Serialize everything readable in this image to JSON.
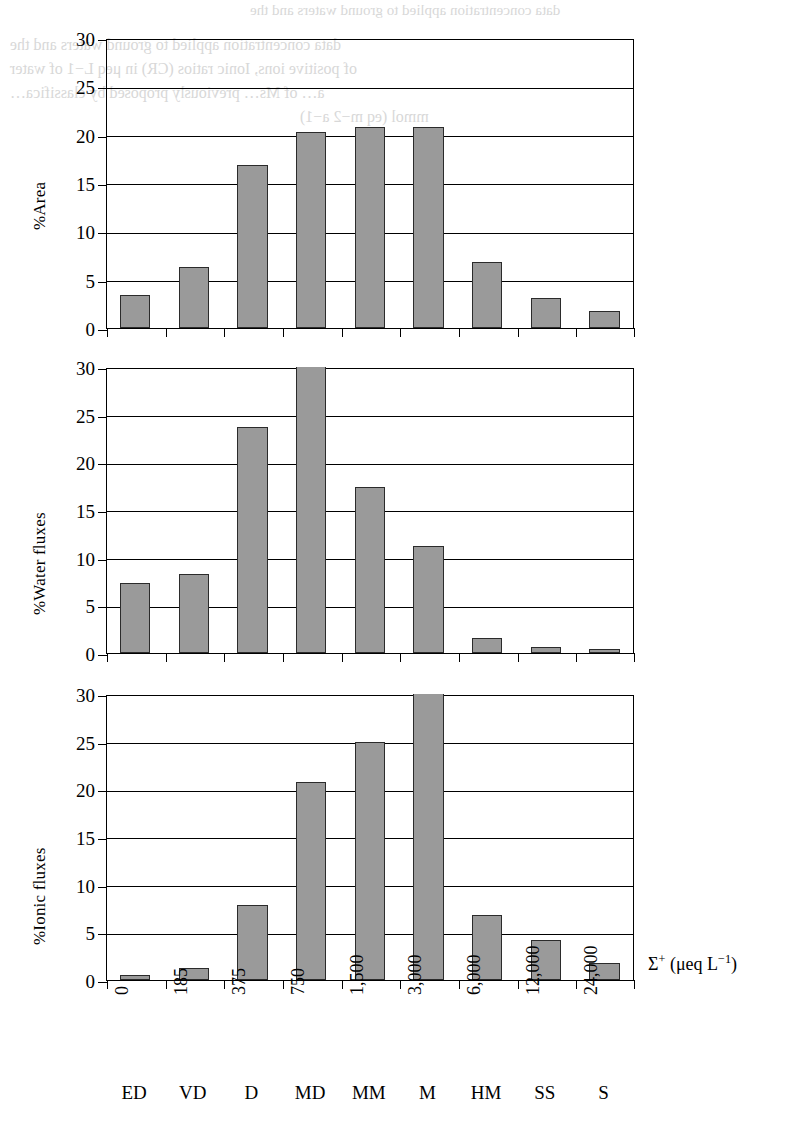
{
  "figure": {
    "background_color": "#ffffff",
    "bar_fill_color": "#9a9a9a",
    "bar_edge_color": "#2b2b2b",
    "axis_color": "#000000"
  },
  "x_axis": {
    "title_main": "Σ",
    "title_sup": "+",
    "title_units": " (μeq L",
    "title_units_sup": "−1",
    "title_units_end": ")",
    "tick_labels": [
      "0",
      "185",
      "375",
      "750",
      "1,500",
      "3,000",
      "6,000",
      "12,000",
      "24,000"
    ],
    "category_labels": [
      "ED",
      "VD",
      "D",
      "MD",
      "MM",
      "M",
      "HM",
      "SS",
      "S"
    ]
  },
  "y_axis": {
    "tick_labels": [
      "0",
      "5",
      "10",
      "15",
      "20",
      "25",
      "30"
    ],
    "min": 0,
    "max": 30
  },
  "chart_data": [
    {
      "type": "bar",
      "title": "",
      "ylabel": "%Area",
      "xlabel": "Σ+ (μeq L−1)",
      "categories": [
        "ED",
        "VD",
        "D",
        "MD",
        "MM",
        "M",
        "HM",
        "SS",
        "S"
      ],
      "tick_values": [
        "0",
        "185",
        "375",
        "750",
        "1,500",
        "3,000",
        "6,000",
        "12,000",
        "24,000"
      ],
      "values": [
        3.4,
        6.3,
        16.9,
        20.3,
        20.8,
        20.8,
        6.8,
        3.1,
        1.8
      ],
      "clipped": [
        false,
        false,
        false,
        false,
        false,
        false,
        false,
        false,
        false
      ],
      "ylim": [
        0,
        30
      ],
      "yticks": [
        0,
        5,
        10,
        15,
        20,
        25,
        30
      ],
      "grid": true,
      "legend": "none"
    },
    {
      "type": "bar",
      "title": "",
      "ylabel": "%Water fluxes",
      "xlabel": "Σ+ (μeq L−1)",
      "categories": [
        "ED",
        "VD",
        "D",
        "MD",
        "MM",
        "M",
        "HM",
        "SS",
        "S"
      ],
      "tick_values": [
        "0",
        "185",
        "375",
        "750",
        "1,500",
        "3,000",
        "6,000",
        "12,000",
        "24,000"
      ],
      "values": [
        7.3,
        8.3,
        23.7,
        30.0,
        17.4,
        11.2,
        1.6,
        0.6,
        0.4
      ],
      "clipped": [
        false,
        false,
        false,
        true,
        false,
        false,
        false,
        false,
        false
      ],
      "ylim": [
        0,
        30
      ],
      "yticks": [
        0,
        5,
        10,
        15,
        20,
        25,
        30
      ],
      "grid": true,
      "legend": "none"
    },
    {
      "type": "bar",
      "title": "",
      "ylabel": "%Ionic fluxes",
      "xlabel": "Σ+ (μeq L−1)",
      "categories": [
        "ED",
        "VD",
        "D",
        "MD",
        "MM",
        "M",
        "HM",
        "SS",
        "S"
      ],
      "tick_values": [
        "0",
        "185",
        "375",
        "750",
        "1,500",
        "3,000",
        "6,000",
        "12,000",
        "24,000"
      ],
      "values": [
        0.5,
        1.3,
        7.9,
        20.8,
        25.0,
        30.0,
        6.8,
        4.2,
        1.8
      ],
      "clipped": [
        false,
        false,
        false,
        false,
        false,
        true,
        false,
        false,
        false
      ],
      "ylim": [
        0,
        30
      ],
      "yticks": [
        0,
        5,
        10,
        15,
        20,
        25,
        30
      ],
      "grid": true,
      "legend": "none"
    }
  ],
  "ghost_text": {
    "lines": [
      "data concentration applied to ground waters and the",
      "of positive ions, Ionic ratios (CR) in μeq L−1 of water",
      "a… of Ms… previously proposed by classifica…",
      "mmol (eq m−2 a−1)"
    ]
  }
}
